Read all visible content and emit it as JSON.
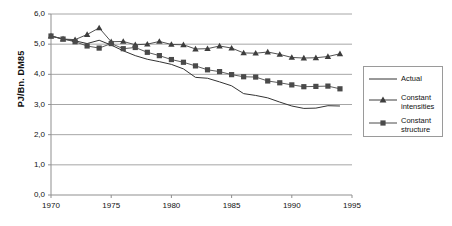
{
  "chart_data": {
    "type": "line",
    "title": "",
    "xlabel": "",
    "ylabel": "PJ/Bn. DM85",
    "xlim": [
      1970,
      1995
    ],
    "ylim": [
      0.0,
      6.0
    ],
    "xticks": [
      "1970",
      "1975",
      "1980",
      "1985",
      "1990",
      "1995"
    ],
    "xtick_values": [
      1970,
      1975,
      1980,
      1985,
      1990,
      1995
    ],
    "yticks": [
      "0,0",
      "1,0",
      "2,0",
      "3,0",
      "4,0",
      "5,0",
      "6,0"
    ],
    "ytick_values": [
      0.0,
      1.0,
      2.0,
      3.0,
      4.0,
      5.0,
      6.0
    ],
    "grid": "horizontal",
    "legend_position": "right-outside",
    "x": [
      1970,
      1971,
      1972,
      1973,
      1974,
      1975,
      1976,
      1977,
      1978,
      1979,
      1980,
      1981,
      1982,
      1983,
      1984,
      1985,
      1986,
      1987,
      1988,
      1989,
      1990,
      1991,
      1992,
      1993,
      1994
    ],
    "series": [
      {
        "name": "Actual",
        "marker": "none",
        "color": "#333333",
        "values": [
          5.27,
          5.17,
          5.11,
          5.02,
          5.13,
          4.97,
          4.78,
          4.62,
          4.5,
          4.42,
          4.33,
          4.18,
          3.9,
          3.87,
          3.75,
          3.62,
          3.36,
          3.3,
          3.22,
          3.08,
          2.95,
          2.87,
          2.88,
          2.96,
          2.95
        ]
      },
      {
        "name": "Constant\nintensities",
        "marker": "triangle",
        "color": "#3d3d3d",
        "values": [
          5.27,
          5.17,
          5.15,
          5.32,
          5.54,
          5.08,
          5.09,
          4.98,
          5.0,
          5.09,
          4.99,
          4.98,
          4.84,
          4.85,
          4.94,
          4.87,
          4.71,
          4.7,
          4.74,
          4.66,
          4.56,
          4.54,
          4.55,
          4.59,
          4.68
        ]
      },
      {
        "name": "Constant\nstructure",
        "marker": "square",
        "color": "#4a4a4a",
        "values": [
          5.27,
          5.17,
          5.08,
          4.94,
          4.87,
          5.02,
          4.85,
          4.89,
          4.73,
          4.62,
          4.49,
          4.4,
          4.28,
          4.15,
          4.09,
          3.99,
          3.92,
          3.91,
          3.78,
          3.72,
          3.65,
          3.59,
          3.6,
          3.61,
          3.52
        ]
      }
    ],
    "legend_entries": [
      {
        "label": "Actual",
        "marker": "none"
      },
      {
        "label": "Constant\nintensities",
        "marker": "triangle"
      },
      {
        "label": "Constant\nstructure",
        "marker": "square"
      }
    ]
  },
  "axis": {
    "y_axis_title": "PJ/Bn. DM85"
  }
}
